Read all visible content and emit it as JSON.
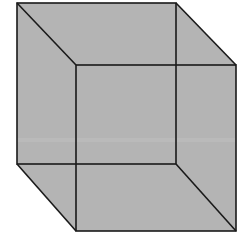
{
  "figure": {
    "fill_color": "#b4b4b4",
    "edge_color": "#1a1a1a",
    "band_color": "#c0c0c0",
    "faces": {
      "back_square": {
        "label": ""
      },
      "front_square": {
        "label": ""
      }
    },
    "edges": [
      "top-left-diagonal",
      "top-right-diagonal",
      "bottom-left-diagonal",
      "bottom-right-diagonal"
    ]
  }
}
